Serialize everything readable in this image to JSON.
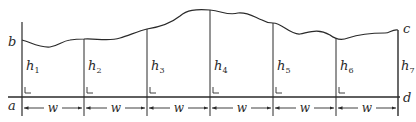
{
  "diagram": {
    "type": "trapezoidal-rule-area-strips",
    "corner_labels": {
      "a": "a",
      "b": "b",
      "c": "c",
      "d": "d"
    },
    "ordinates": [
      {
        "label": "h",
        "sub": "1"
      },
      {
        "label": "h",
        "sub": "2"
      },
      {
        "label": "h",
        "sub": "3"
      },
      {
        "label": "h",
        "sub": "4"
      },
      {
        "label": "h",
        "sub": "5"
      },
      {
        "label": "h",
        "sub": "6"
      },
      {
        "label": "h",
        "sub": "7"
      }
    ],
    "interval_label": "w",
    "interval_count": 6,
    "colors": {
      "line": "#2a2a2a",
      "background": "#ffffff"
    }
  }
}
